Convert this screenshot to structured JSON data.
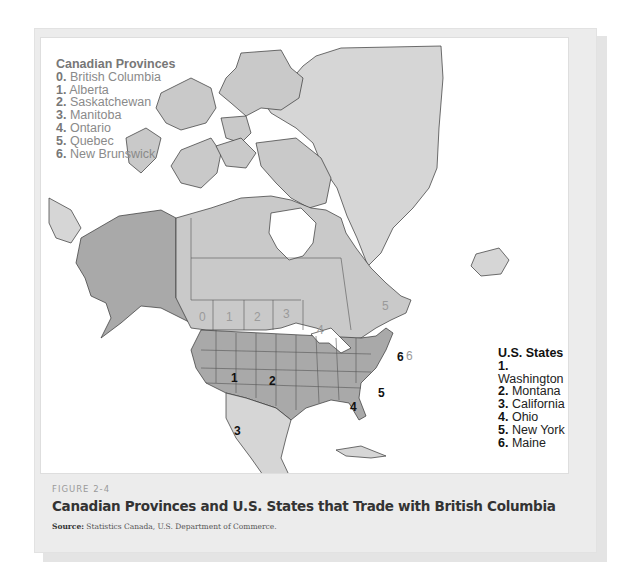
{
  "figure": {
    "label": "FIGURE 2-4",
    "title": "Canadian Provinces and U.S. States that Trade with British Columbia",
    "source_label": "Source:",
    "source_text": " Statistics Canada, U.S. Department of Commerce."
  },
  "legend_canada": {
    "title": "Canadian Provinces",
    "items": [
      {
        "num": "0.",
        "name": " British Columbia"
      },
      {
        "num": "1.",
        "name": " Alberta"
      },
      {
        "num": "2.",
        "name": " Saskatchewan"
      },
      {
        "num": "3.",
        "name": " Manitoba"
      },
      {
        "num": "4.",
        "name": " Ontario"
      },
      {
        "num": "5.",
        "name": " Quebec"
      },
      {
        "num": "6.",
        "name": " New Brunswick"
      }
    ]
  },
  "legend_us": {
    "title": "U.S. States",
    "items": [
      {
        "num": "1.",
        "name": " Washington"
      },
      {
        "num": "2.",
        "name": " Montana"
      },
      {
        "num": "3.",
        "name": " California"
      },
      {
        "num": "4.",
        "name": " Ohio"
      },
      {
        "num": "5.",
        "name": " New York"
      },
      {
        "num": "6.",
        "name": " Maine"
      }
    ]
  },
  "map_labels": {
    "canada": [
      "0",
      "1",
      "2",
      "3",
      "4",
      "5",
      "6"
    ],
    "us": [
      "1",
      "2",
      "3",
      "4",
      "5",
      "6"
    ]
  },
  "colors": {
    "us_fill": "#a9a9a9",
    "canada_fill": "#c9c9c9",
    "other_land": "#d6d6d6",
    "water": "#ffffff",
    "frame": "#ececec"
  }
}
